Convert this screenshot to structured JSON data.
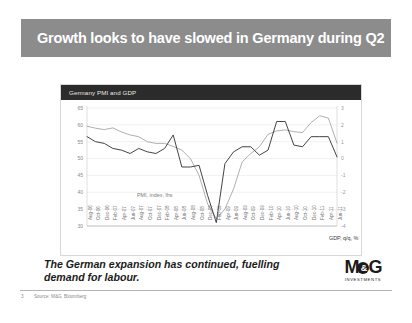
{
  "slide": {
    "title": "Growth looks to have slowed in Germany during Q2",
    "caption": "The German expansion has continued, fuelling demand for labour.",
    "slide_number": "3",
    "source": "Source: M&G, Bloomberg",
    "title_banner_color": "#8c8c8c"
  },
  "logo": {
    "left": "M",
    "amp": "&",
    "right": "G",
    "subtitle": "INVESTMENTS"
  },
  "chart_data": {
    "type": "line",
    "title": "Germany PMI and GDP",
    "xlabel": "",
    "ylabel": "PMI, index",
    "y2label": "GDP, q/q, %",
    "grid": true,
    "legend": "inline-annotations",
    "ylim": [
      30,
      65
    ],
    "yticks": [
      65,
      60,
      55,
      50,
      45,
      40,
      35,
      30
    ],
    "y2lim": [
      -4,
      3
    ],
    "y2ticks": [
      3,
      2,
      1,
      0,
      -1,
      -2,
      -3,
      -4
    ],
    "annotations": [
      {
        "text": "PMI, index, lhs",
        "series": "PMI"
      },
      {
        "text": "GDP, q/q, %",
        "series": "GDP"
      }
    ],
    "categories": [
      "Aug-06",
      "Oct-06",
      "Dec-06",
      "Feb-07",
      "Apr-07",
      "Jun-07",
      "Aug-07",
      "Oct-07",
      "Dec-07",
      "Feb-08",
      "Apr-08",
      "Jun-08",
      "Aug-08",
      "Oct-08",
      "Dec-08",
      "Feb-09",
      "Apr-09",
      "Jun-09",
      "Aug-09",
      "Oct-09",
      "Dec-09",
      "Feb-10",
      "Apr-10",
      "Jun-10",
      "Aug-10",
      "Oct-10",
      "Dec-10",
      "Feb-11",
      "Apr-11",
      "Jun-11"
    ],
    "series": [
      {
        "name": "PMI, index, lhs",
        "axis": "left",
        "color": "#9a9a9a",
        "values": [
          59.6,
          59.0,
          58.6,
          59.1,
          57.9,
          57.0,
          56.5,
          55.0,
          54.5,
          54.5,
          53.6,
          52.5,
          50.0,
          45.0,
          36.5,
          32.2,
          35.0,
          41.0,
          49.0,
          51.5,
          53.5,
          57.2,
          58.2,
          58.5,
          58.0,
          57.7,
          60.7,
          62.7,
          62.0,
          54.6
        ]
      },
      {
        "name": "GDP, q/q, %",
        "axis": "right",
        "color": "#3a3a3a",
        "values": [
          1.3,
          1.0,
          0.9,
          0.6,
          0.5,
          0.3,
          0.6,
          0.4,
          0.3,
          0.6,
          1.4,
          -0.5,
          -0.5,
          -0.4,
          -2.2,
          -3.8,
          -0.3,
          0.4,
          0.7,
          0.7,
          0.2,
          0.5,
          2.2,
          2.2,
          0.8,
          0.7,
          1.3,
          1.3,
          1.3,
          0.1
        ]
      }
    ]
  }
}
